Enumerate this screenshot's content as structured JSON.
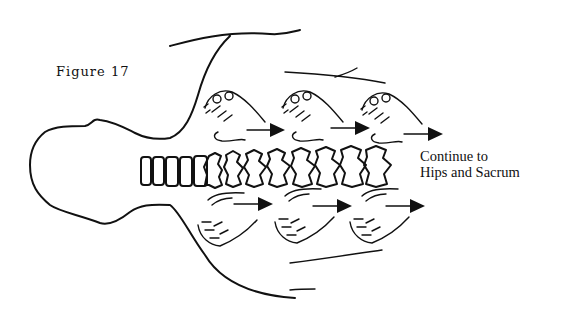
{
  "figure": {
    "label": "Figure 17",
    "caption_line1": "Continue to",
    "caption_line2": "Hips and Sacrum"
  },
  "diagram": {
    "elements": [
      "head-outline",
      "torso-outline",
      "spine",
      "upper-hands",
      "lower-hands",
      "direction-arrows"
    ],
    "upper_hand_count": 3,
    "lower_hand_count": 3,
    "arrow_direction": "right",
    "line_color": "#111111",
    "background": "#ffffff"
  }
}
